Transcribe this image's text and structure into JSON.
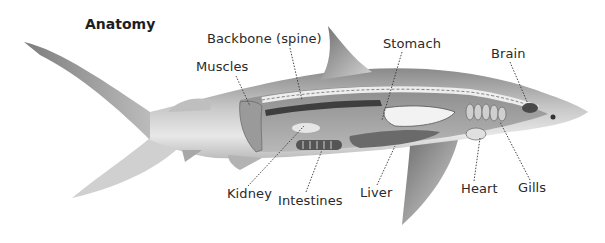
{
  "title": "Anatomy",
  "labels": {
    "backbone": "Backbone (spine)",
    "muscles": "Muscles",
    "stomach": "Stomach",
    "brain": "Brain",
    "kidney": "Kidney",
    "intestines": "Intestines",
    "liver": "Liver",
    "heart": "Heart",
    "gills": "Gills"
  },
  "colors": {
    "background": "#ffffff",
    "text": "#2a2a2a",
    "body_light": "#d9d9d9",
    "body_dark": "#7a7a7a",
    "organ_dark": "#3a3a3a",
    "leader_line": "#333333"
  }
}
